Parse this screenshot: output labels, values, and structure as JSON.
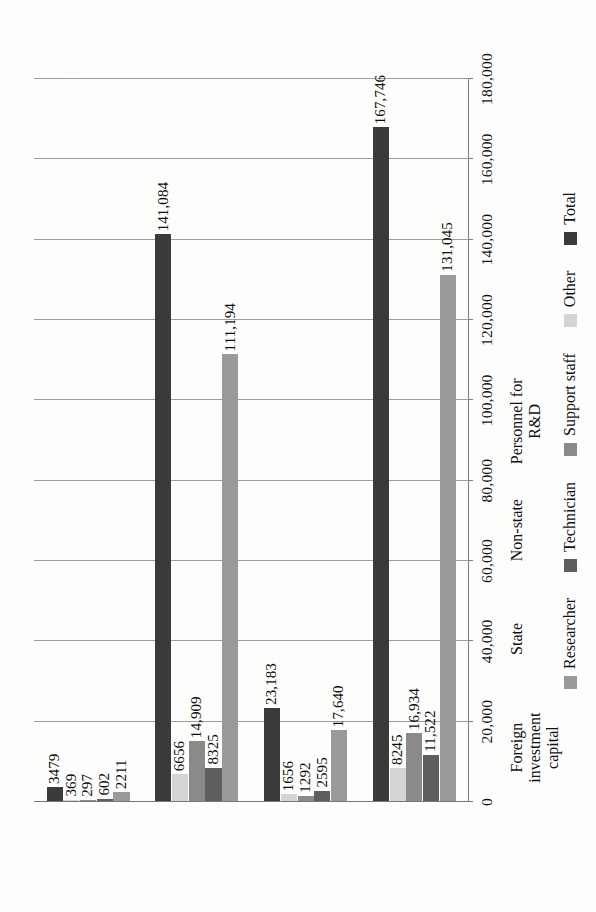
{
  "chart_data": {
    "type": "bar",
    "title": "",
    "xlabel": "",
    "ylabel": "",
    "orientation": "rotated-90-ccw",
    "grid": true,
    "legend_position": "bottom",
    "ylim": [
      0,
      180000
    ],
    "yticks": [
      0,
      20000,
      40000,
      60000,
      80000,
      100000,
      120000,
      140000,
      160000,
      180000
    ],
    "ytick_labels": [
      "0",
      "20,000",
      "40,000",
      "60,000",
      "80,000",
      "100,000",
      "120,000",
      "140,000",
      "160,000",
      "180,000"
    ],
    "categories": [
      "Foreign investment\ncapital",
      "State",
      "Non-state",
      "Personnel for R&D"
    ],
    "series": [
      {
        "name": "Researcher",
        "color": "#9a9a9a",
        "values": [
          2211,
          111194,
          17640,
          131045
        ],
        "labels": [
          "2211",
          "111,194",
          "17,640",
          "131,045"
        ]
      },
      {
        "name": "Technician",
        "color": "#5e5e5e",
        "values": [
          602,
          8325,
          2595,
          11522
        ],
        "labels": [
          "602",
          "8325",
          "2595",
          "11,522"
        ]
      },
      {
        "name": "Support staff",
        "color": "#8a8a8a",
        "values": [
          297,
          14909,
          1292,
          16934
        ],
        "labels": [
          "297",
          "14,909",
          "1292",
          "16,934"
        ]
      },
      {
        "name": "Other",
        "color": "#d4d4d4",
        "values": [
          369,
          6656,
          1656,
          8245
        ],
        "labels": [
          "369",
          "6656",
          "1656",
          "8245"
        ]
      },
      {
        "name": "Total",
        "color": "#3a3a3a",
        "values": [
          3479,
          141084,
          23183,
          167746
        ],
        "labels": [
          "3479",
          "141,084",
          "23,183",
          "167,746"
        ]
      }
    ]
  }
}
